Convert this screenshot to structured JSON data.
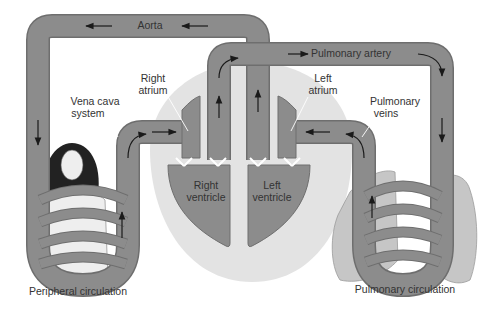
{
  "diagram": {
    "colors": {
      "vessel": "#8c8c8c",
      "vessel_edge": "#6e6e6e",
      "heart_halo": "#e3e3e3",
      "lung": "#c6c6c6",
      "body_skin": "#eeeeee",
      "hair": "#222222",
      "arrow": "#1a1a1a",
      "text": "#333333",
      "background": "#ffffff"
    },
    "labels": {
      "aorta": "Aorta",
      "pulmonary_artery": "Pulmonary artery",
      "right_atrium_1": "Right",
      "right_atrium_2": "atrium",
      "left_atrium_1": "Left",
      "left_atrium_2": "atrium",
      "vena_cava_1": "Vena cava",
      "vena_cava_2": "system",
      "pulmonary_veins_1": "Pulmonary",
      "pulmonary_veins_2": "veins",
      "right_ventricle_1": "Right",
      "right_ventricle_2": "ventricle",
      "left_ventricle_1": "Left",
      "left_ventricle_2": "ventricle",
      "peripheral_circulation": "Peripheral circulation",
      "pulmonary_circulation": "Pulmonary circulation"
    },
    "nodes": [
      {
        "id": "aorta",
        "label": "Aorta"
      },
      {
        "id": "pulmonary-artery",
        "label": "Pulmonary artery"
      },
      {
        "id": "right-atrium",
        "label": "Right atrium"
      },
      {
        "id": "left-atrium",
        "label": "Left atrium"
      },
      {
        "id": "right-ventricle",
        "label": "Right ventricle"
      },
      {
        "id": "left-ventricle",
        "label": "Left ventricle"
      },
      {
        "id": "vena-cava",
        "label": "Vena cava system"
      },
      {
        "id": "pulmonary-veins",
        "label": "Pulmonary veins"
      },
      {
        "id": "peripheral",
        "label": "Peripheral circulation"
      },
      {
        "id": "pulmonary",
        "label": "Pulmonary circulation"
      }
    ],
    "flow": [
      [
        "left-ventricle",
        "aorta"
      ],
      [
        "aorta",
        "peripheral"
      ],
      [
        "peripheral",
        "vena-cava"
      ],
      [
        "vena-cava",
        "right-atrium"
      ],
      [
        "right-atrium",
        "right-ventricle"
      ],
      [
        "right-ventricle",
        "pulmonary-artery"
      ],
      [
        "pulmonary-artery",
        "pulmonary"
      ],
      [
        "pulmonary",
        "pulmonary-veins"
      ],
      [
        "pulmonary-veins",
        "left-atrium"
      ],
      [
        "left-atrium",
        "left-ventricle"
      ]
    ]
  }
}
